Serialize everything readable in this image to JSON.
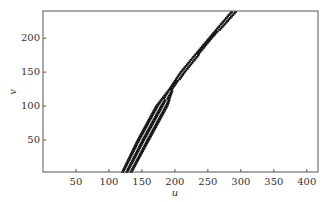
{
  "chart_data": {
    "type": "scatter",
    "title": "",
    "xlabel": "u",
    "ylabel": "v",
    "xlim": [
      0,
      417
    ],
    "ylim": [
      3,
      240
    ],
    "xticks": [
      50,
      100,
      150,
      200,
      250,
      300,
      350,
      400
    ],
    "yticks": [
      50,
      100,
      150,
      200
    ],
    "grid": false,
    "legend": null,
    "series": [
      {
        "name": "points",
        "marker": "short horizontal dash",
        "color": "#111111",
        "band_edges": {
          "v": [
            0,
            50,
            100,
            125,
            150,
            200,
            240
          ],
          "u_left": [
            117,
            142,
            170,
            190,
            207,
            250,
            285
          ],
          "u_right": [
            136,
            164,
            192,
            200,
            218,
            260,
            297
          ]
        }
      }
    ]
  }
}
